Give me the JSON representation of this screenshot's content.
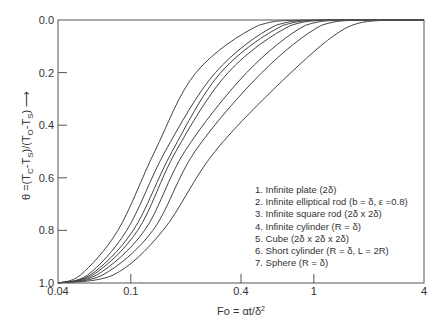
{
  "chart_data": {
    "type": "line",
    "title": "",
    "xlabel": "Fo = αt/δ²",
    "ylabel": "θ =(T_C-T_S)/(T_O-T_S) ⟶",
    "xscale": "log",
    "xlim": [
      0.04,
      4
    ],
    "ylim": [
      1.0,
      0.0
    ],
    "y_inverted": true,
    "grid": false,
    "legend_position": "lower right inside",
    "x_ticks": [
      0.04,
      0.1,
      0.4,
      1,
      4
    ],
    "x_tick_labels": [
      "0.04",
      "0.1",
      "0.4",
      "1",
      "4"
    ],
    "y_ticks": [
      0.0,
      0.2,
      0.4,
      0.6,
      0.8,
      1.0
    ],
    "y_tick_labels": [
      "0.0",
      "0.2",
      "0.4",
      "0.6",
      "0.8",
      "1.0"
    ],
    "series": [
      {
        "name": "1. Infinite plate (2δ)",
        "points": [
          [
            0.04,
            1.0
          ],
          [
            0.08,
            0.97
          ],
          [
            0.15,
            0.8
          ],
          [
            0.288,
            0.5
          ],
          [
            0.75,
            0.2
          ],
          [
            1.5,
            0.03
          ],
          [
            2.5,
            0.0
          ],
          [
            4,
            0.0
          ]
        ]
      },
      {
        "name": "2. Infinite elliptical rod (b = δ, ε =0.8)",
        "points": [
          [
            0.04,
            1.0
          ],
          [
            0.07,
            0.97
          ],
          [
            0.132,
            0.8
          ],
          [
            0.224,
            0.5
          ],
          [
            0.52,
            0.2
          ],
          [
            1.1,
            0.02
          ],
          [
            1.8,
            0.0
          ],
          [
            4,
            0.0
          ]
        ]
      },
      {
        "name": "3. Infinite square rod (2δ x 2δ)",
        "points": [
          [
            0.04,
            1.0
          ],
          [
            0.065,
            0.97
          ],
          [
            0.119,
            0.8
          ],
          [
            0.197,
            0.5
          ],
          [
            0.43,
            0.2
          ],
          [
            0.9,
            0.02
          ],
          [
            1.5,
            0.0
          ],
          [
            4,
            0.0
          ]
        ]
      },
      {
        "name": "4. Infinite cylinder (R = δ)",
        "points": [
          [
            0.04,
            1.0
          ],
          [
            0.062,
            0.97
          ],
          [
            0.109,
            0.8
          ],
          [
            0.176,
            0.5
          ],
          [
            0.34,
            0.2
          ],
          [
            0.75,
            0.02
          ],
          [
            1.3,
            0.0
          ],
          [
            4,
            0.0
          ]
        ]
      },
      {
        "name": "5. Cube (2δ x 2δ x 2δ)",
        "points": [
          [
            0.04,
            1.0
          ],
          [
            0.06,
            0.97
          ],
          [
            0.103,
            0.8
          ],
          [
            0.168,
            0.5
          ],
          [
            0.31,
            0.2
          ],
          [
            0.68,
            0.02
          ],
          [
            1.2,
            0.0
          ],
          [
            4,
            0.0
          ]
        ]
      },
      {
        "name": "6. Short cylinder (R = δ, L = 2R)",
        "points": [
          [
            0.04,
            1.0
          ],
          [
            0.058,
            0.97
          ],
          [
            0.095,
            0.8
          ],
          [
            0.154,
            0.5
          ],
          [
            0.29,
            0.2
          ],
          [
            0.62,
            0.02
          ],
          [
            1.1,
            0.0
          ],
          [
            4,
            0.0
          ]
        ]
      },
      {
        "name": "7. Sphere (R = δ)",
        "points": [
          [
            0.04,
            1.0
          ],
          [
            0.053,
            0.97
          ],
          [
            0.085,
            0.8
          ],
          [
            0.135,
            0.5
          ],
          [
            0.227,
            0.2
          ],
          [
            0.5,
            0.02
          ],
          [
            0.9,
            0.0
          ],
          [
            4,
            0.0
          ]
        ]
      }
    ]
  },
  "axes": {
    "x_title_main": "Fo = αt/δ",
    "x_title_sup": "2",
    "y_title": "θ =(T",
    "y_title_parts": [
      "θ =(T",
      "C",
      "-T",
      "S",
      ")/(T",
      "O",
      "-T",
      "S",
      ")"
    ],
    "y_arrow": "⟶"
  },
  "legend": [
    "1. Infinite plate (2δ)",
    "2. Infinite elliptical rod (b = δ, ε =0.8)",
    "3. Infinite square rod (2δ x 2δ)",
    "4. Infinite cylinder (R = δ)",
    "5. Cube (2δ x 2δ x 2δ)",
    "6. Short cylinder (R = δ, L = 2R)",
    "7. Sphere (R = δ)"
  ]
}
